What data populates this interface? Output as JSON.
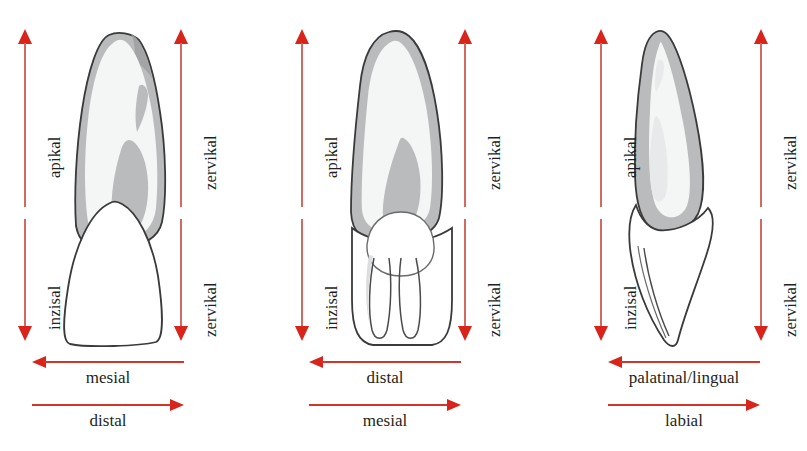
{
  "figure": {
    "background": "#ffffff",
    "arrow_color": "#d8251c",
    "shaft_color": "#cf6b62",
    "text_color": "#231f20",
    "enamel_fill": "#ffffff",
    "dentin_fill": "#f1f2f2",
    "root_band_fill": "#b9bbbd",
    "pulp_fill": "#ffffff",
    "outline_color": "#3a3a3a"
  },
  "panels": [
    {
      "id": "panel-mesial-view",
      "tooth_name": "upper-incisor-proximal-view",
      "left_axis": {
        "name": "apikal-inzisal-axis",
        "upper_label": "apikal",
        "lower_label": "inzisal"
      },
      "right_axis": {
        "name": "zervikal-axis",
        "upper_label": "zervikal",
        "lower_label": "zervikal"
      },
      "horizontal_axes": [
        {
          "name": "mesial-arrow",
          "direction": "left",
          "label": "mesial"
        },
        {
          "name": "distal-arrow",
          "direction": "right",
          "label": "distal"
        }
      ]
    },
    {
      "id": "panel-distal-view",
      "tooth_name": "upper-incisor-proximal-view-mirrored",
      "left_axis": {
        "name": "apikal-inzisal-axis",
        "upper_label": "apikal",
        "lower_label": "inzisal"
      },
      "right_axis": {
        "name": "zervikal-axis",
        "upper_label": "zervikal",
        "lower_label": "zervikal"
      },
      "horizontal_axes": [
        {
          "name": "distal-arrow",
          "direction": "left",
          "label": "distal"
        },
        {
          "name": "mesial-arrow",
          "direction": "right",
          "label": "mesial"
        }
      ]
    },
    {
      "id": "panel-labial-view",
      "tooth_name": "upper-incisor-sagittal-view",
      "left_axis": {
        "name": "apikal-inzisal-axis",
        "upper_label": "apikal",
        "lower_label": "inzisal"
      },
      "right_axis": {
        "name": "zervikal-axis",
        "upper_label": "zervikal",
        "lower_label": "zervikal"
      },
      "horizontal_axes": [
        {
          "name": "palatinal-lingual-arrow",
          "direction": "left",
          "label": "palatinal/lingual"
        },
        {
          "name": "labial-arrow",
          "direction": "right",
          "label": "labial"
        }
      ]
    }
  ]
}
